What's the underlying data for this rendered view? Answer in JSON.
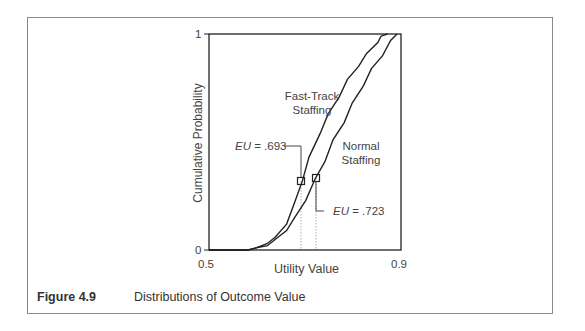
{
  "caption": {
    "figure_number": "Figure 4.9",
    "title": "Distributions of Outcome Value"
  },
  "axes": {
    "xlabel": "Utility Value",
    "ylabel": "Cumulative Probability",
    "x_tick_min": "0.5",
    "x_tick_max": "0.9",
    "y_tick_min": "0",
    "y_tick_max": "1"
  },
  "labels": {
    "fast_track_line1": "Fast-Track",
    "fast_track_line2": "Staffing",
    "normal_line1": "Normal",
    "normal_line2": "Staffing",
    "eu_fast_track_prefix": "EU",
    "eu_fast_track_value": " = .693",
    "eu_normal_prefix": "EU",
    "eu_normal_value": " = .723"
  },
  "chart_data": {
    "type": "line",
    "title": "Distributions of Outcome Value",
    "xlabel": "Utility Value",
    "ylabel": "Cumulative Probability",
    "xlim": [
      0.5,
      0.9
    ],
    "ylim": [
      0,
      1
    ],
    "grid": false,
    "legend_position": "inline labels",
    "series": [
      {
        "name": "Fast-Track Staffing",
        "x": [
          0.55,
          0.58,
          0.6,
          0.62,
          0.64,
          0.66,
          0.68,
          0.693,
          0.71,
          0.73,
          0.75,
          0.77,
          0.79,
          0.81,
          0.83,
          0.85,
          0.86,
          0.87
        ],
        "y": [
          0.0,
          0.0,
          0.01,
          0.03,
          0.06,
          0.12,
          0.22,
          0.32,
          0.43,
          0.54,
          0.63,
          0.71,
          0.79,
          0.85,
          0.91,
          0.96,
          0.99,
          1.0
        ],
        "expected_utility": 0.693,
        "marker_probability": 0.32
      },
      {
        "name": "Normal Staffing",
        "x": [
          0.55,
          0.58,
          0.6,
          0.62,
          0.64,
          0.66,
          0.68,
          0.7,
          0.723,
          0.74,
          0.76,
          0.78,
          0.8,
          0.82,
          0.84,
          0.86,
          0.88,
          0.89
        ],
        "y": [
          0.0,
          0.0,
          0.01,
          0.02,
          0.05,
          0.09,
          0.15,
          0.23,
          0.33,
          0.41,
          0.51,
          0.59,
          0.68,
          0.76,
          0.84,
          0.9,
          0.97,
          1.0
        ],
        "expected_utility": 0.723,
        "marker_probability": 0.33
      }
    ],
    "annotations": [
      {
        "text": "EU = .693",
        "x": 0.693,
        "series": "Fast-Track Staffing"
      },
      {
        "text": "EU = .723",
        "x": 0.723,
        "series": "Normal Staffing"
      }
    ]
  }
}
